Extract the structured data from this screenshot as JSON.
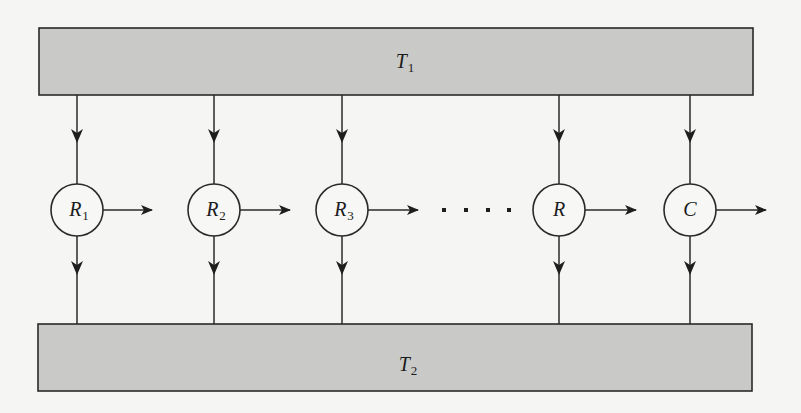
{
  "diagram": {
    "colors": {
      "background": "#f5f5f3",
      "box_fill": "#c9c9c7",
      "stroke": "#2a2a2a",
      "node_fill": "#f7f7f5"
    },
    "top_bus": {
      "label": "T",
      "subscript": "1"
    },
    "bottom_bus": {
      "label": "T",
      "subscript": "2"
    },
    "nodes": [
      {
        "label": "R",
        "subscript": "1"
      },
      {
        "label": "R",
        "subscript": "2"
      },
      {
        "label": "R",
        "subscript": "3"
      },
      {
        "label": "R",
        "subscript": ""
      },
      {
        "label": "C",
        "subscript": ""
      }
    ],
    "ellipsis": "· · · ·",
    "edges": [
      "T1 → R1",
      "T1 → R2",
      "T1 → R3",
      "T1 → R",
      "T1 → C",
      "R1 → T2",
      "R2 → T2",
      "R3 → T2",
      "R → T2",
      "C → T2",
      "R1 →",
      "R2 →",
      "R3 →",
      "R →",
      "C →"
    ]
  }
}
